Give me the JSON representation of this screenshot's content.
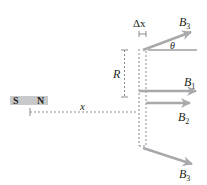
{
  "diagram": {
    "magnet": {
      "south_label": "S",
      "north_label": "N",
      "color": "#c8c9ca"
    },
    "labels": {
      "x": "x",
      "R": "R",
      "delta_x": "Δx",
      "theta": "θ",
      "B3_top": "B",
      "B3_top_sub": "3",
      "B1": "B",
      "B1_sub": "1",
      "B2": "B",
      "B2_sub": "2",
      "B3_bottom": "B",
      "B3_bottom_sub": "3"
    },
    "colors": {
      "arrow": "#a7a9ac",
      "line": "#6d6e71",
      "text": "#231f20"
    }
  }
}
